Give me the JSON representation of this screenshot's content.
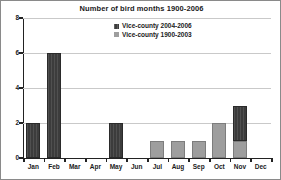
{
  "chart_data": {
    "type": "bar",
    "title": "Number of bird months 1900-2006",
    "xlabel": "",
    "ylabel": "",
    "stacked": true,
    "grid": true,
    "ylim": [
      0,
      8
    ],
    "ytick_labels": [
      "0",
      "2",
      "4",
      "6",
      "8"
    ],
    "ytick_values": [
      0,
      2,
      4,
      6,
      8
    ],
    "categories": [
      "Jan",
      "Feb",
      "Mar",
      "Apr",
      "May",
      "Jun",
      "Jul",
      "Aug",
      "Sep",
      "Oct",
      "Nov",
      "Dec"
    ],
    "legend_position": "inside-top-center",
    "series": [
      {
        "name": "Vice-county 2004-2006",
        "color": "#3c3c3c",
        "values": [
          2,
          6,
          0,
          0,
          2,
          0,
          0,
          0,
          0,
          0,
          2,
          0
        ]
      },
      {
        "name": "Vice-county 1900-2003",
        "color": "#9e9e9e",
        "values": [
          0,
          0,
          0,
          0,
          0,
          0,
          1,
          1,
          1,
          2,
          1,
          0
        ]
      }
    ],
    "totals": [
      2,
      6,
      0,
      0,
      2,
      0,
      1,
      1,
      1,
      2,
      3,
      0
    ]
  }
}
